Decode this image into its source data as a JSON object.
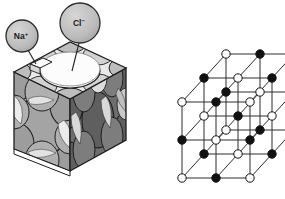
{
  "figure": {
    "background_color": "#ffffff"
  },
  "callouts": [
    {
      "id": "na",
      "label": "Na",
      "charge": "+",
      "full_label": "Na⁺",
      "bubble_cx": 22,
      "bubble_cy": 36,
      "bubble_r": 16,
      "leader_x1": 28,
      "leader_y1": 50,
      "leader_x2": 36,
      "leader_y2": 64,
      "fill": "#b9b9b9",
      "stroke": "#2b2b2b"
    },
    {
      "id": "cl",
      "label": "Cl",
      "charge": "−",
      "full_label": "Cl⁻",
      "bubble_cx": 80,
      "bubble_cy": 23,
      "bubble_r": 20,
      "leader_x1": 79,
      "leader_y1": 43,
      "leader_x2": 72,
      "leader_y2": 71,
      "fill": "#b9b9b9",
      "stroke": "#2b2b2b"
    }
  ],
  "space_filling_model": {
    "name": "space-filling-cube",
    "description": "Cut-away cube of close-packed chloride and sodium ions",
    "faces": {
      "top_fill": "#e8e8e8",
      "front_fill": "#d0d0d0",
      "right_fill": "#6e6e6e"
    },
    "ion_colors": {
      "chloride_light": "#ffffff",
      "chloride_gray": "#9a9a9a",
      "sodium_gray": "#b5b5b5",
      "outline": "#1f1f1f",
      "shadow": "#7a7a7a"
    }
  },
  "lattice_model": {
    "name": "ball-and-stick-lattice",
    "description": "3 x 3 x 3 rock-salt lattice in oblique projection",
    "grid_size": 3,
    "origin_x": 182,
    "origin_y": 178,
    "step_x": 34,
    "step_y": -38,
    "depth_x": 22,
    "depth_y": -24,
    "bond_color": "#2c2c2c",
    "bond_width": 1.0,
    "node_radius": 4.2,
    "node_stroke": "#111111",
    "node_fill_anion": "#ffffff",
    "node_fill_cation": "#111111",
    "legend": {
      "filled_means": "Na⁺",
      "open_means": "Cl⁻"
    }
  }
}
